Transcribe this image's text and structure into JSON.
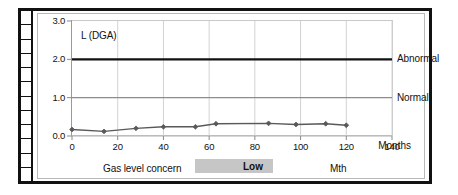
{
  "chart_data": {
    "type": "line",
    "title": "L (DGA)",
    "xlabel": "Months",
    "ylabel": "",
    "xlim": [
      0,
      140
    ],
    "ylim": [
      0.0,
      3.0
    ],
    "grid": true,
    "legend_position": "right-inline",
    "x_ticks": [
      "0",
      "20",
      "40",
      "60",
      "80",
      "100",
      "120",
      "140"
    ],
    "x_tick_values": [
      0,
      20,
      40,
      60,
      80,
      100,
      120,
      140
    ],
    "y_ticks": [
      "0.0",
      "1.0",
      "2.0",
      "3.0"
    ],
    "y_tick_values": [
      0.0,
      1.0,
      2.0,
      3.0
    ],
    "series": [
      {
        "name": "L (DGA)",
        "marker": "diamond",
        "color": "#595959",
        "x": [
          0,
          14,
          28,
          40,
          54,
          63,
          86,
          98,
          111,
          120
        ],
        "values": [
          0.17,
          0.12,
          0.2,
          0.24,
          0.24,
          0.32,
          0.33,
          0.3,
          0.32,
          0.28
        ]
      }
    ],
    "threshold_lines": [
      {
        "label": "Abnormal",
        "value": 2.0,
        "color": "#111111",
        "width": 2.4
      },
      {
        "label": "Normal",
        "value": 1.0,
        "color": "#8c8c8c",
        "width": 1.1
      }
    ]
  },
  "footer": {
    "concern_label": "Gas level concern",
    "status_value": "Low",
    "unit_label": "Mth",
    "status_bg": "#c6c6c6"
  },
  "ladder": {
    "cell_count": 12
  }
}
